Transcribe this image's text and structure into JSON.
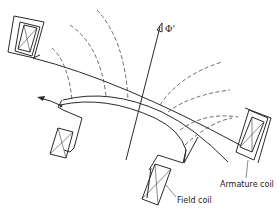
{
  "diagram": {
    "labels": {
      "flux": "Φ'",
      "armature_coil": "Armature coil",
      "field_coil": "Field coil"
    },
    "colors": {
      "stroke": "#2a2a2a",
      "background": "#ffffff"
    }
  }
}
